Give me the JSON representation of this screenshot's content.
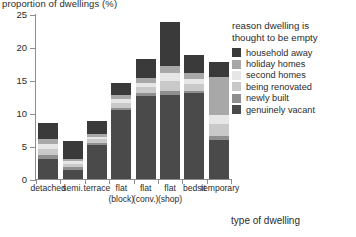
{
  "chart_data": {
    "type": "bar",
    "title": "",
    "ylabel": "proportion of dwellings (%)",
    "xlabel": "type of dwelling",
    "ylim": [
      0,
      25
    ],
    "yticks": [
      0,
      5,
      10,
      15,
      20,
      25
    ],
    "grid": false,
    "stacked": true,
    "legend_position": "top-right",
    "legend_title_line1": "reason dwelling is",
    "legend_title_line2": "thought to be empty",
    "categories": [
      "detached",
      "semi.",
      "terrace",
      "flat (block)",
      "flat (conv.)",
      "flat (shop)",
      "bedsit",
      "temporary"
    ],
    "category_labels": [
      {
        "line1": "detached",
        "line2": ""
      },
      {
        "line1": "semi.",
        "line2": ""
      },
      {
        "line1": "terrace",
        "line2": ""
      },
      {
        "line1": "flat",
        "line2": "(block)"
      },
      {
        "line1": "flat",
        "line2": "(conv.)"
      },
      {
        "line1": "flat",
        "line2": "(shop)"
      },
      {
        "line1": "bedsit",
        "line2": ""
      },
      {
        "line1": "temporary",
        "line2": ""
      }
    ],
    "totals": [
      8.5,
      5.8,
      8.8,
      14.5,
      18.2,
      23.8,
      18.8,
      17.8
    ],
    "series": [
      {
        "name": "genuinely vacant",
        "color": "#4a4a4a",
        "values": [
          3.1,
          1.4,
          5.2,
          10.4,
          12.6,
          12.8,
          13.0,
          5.9
        ]
      },
      {
        "name": "newly built",
        "color": "#8f8f8f",
        "values": [
          0.5,
          0.4,
          0.3,
          0.4,
          0.5,
          0.5,
          0.4,
          0.6
        ]
      },
      {
        "name": "being renovated",
        "color": "#c9c9c9",
        "values": [
          0.9,
          0.5,
          0.5,
          0.7,
          0.8,
          1.5,
          1.0,
          1.9
        ]
      },
      {
        "name": "second homes",
        "color": "#e6e6e6",
        "values": [
          0.8,
          0.4,
          0.4,
          0.6,
          0.7,
          1.2,
          0.7,
          1.3
        ]
      },
      {
        "name": "holiday homes",
        "color": "#a8a8a8",
        "values": [
          0.7,
          0.4,
          0.4,
          0.6,
          0.7,
          1.1,
          1.0,
          5.8
        ]
      },
      {
        "name": "household away",
        "color": "#3a3a3a",
        "values": [
          2.5,
          2.7,
          2.0,
          1.8,
          2.9,
          6.7,
          2.7,
          2.3
        ]
      }
    ],
    "legend_order": [
      "household away",
      "holiday homes",
      "second homes",
      "being renovated",
      "newly built",
      "genuinely vacant"
    ],
    "legend_colors": {
      "household away": "#3a3a3a",
      "holiday homes": "#a8a8a8",
      "second homes": "#e6e6e6",
      "being renovated": "#c9c9c9",
      "newly built": "#8f8f8f",
      "genuinely vacant": "#4a4a4a"
    }
  }
}
